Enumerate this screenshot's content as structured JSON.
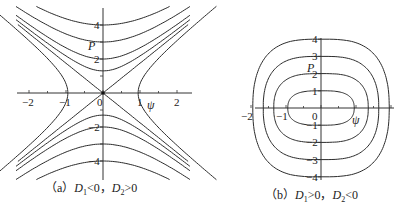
{
  "chart_data": [
    {
      "type": "line",
      "title": "(a) D1<0, D2>0",
      "caption": {
        "prefix": "（a）",
        "d1": "D",
        "d1_sub": "1",
        "rel1": "<0，",
        "d2": "D",
        "d2_sub": "2",
        "rel2": ">0"
      },
      "xlabel": "ψ",
      "ylabel": "P",
      "xlim": [
        -2.3,
        2.3
      ],
      "ylim": [
        -5,
        5
      ],
      "xticks": [
        -2,
        -1,
        0,
        1,
        2
      ],
      "yticks": [
        -4,
        -2,
        2,
        4
      ],
      "grid": false,
      "description": "Phase portrait with saddle at origin: separatrices P=±1.75ψ, hyperbolic level curves above/below and left/right",
      "series": [
        {
          "name": "separatrix-1",
          "kind": "line",
          "slope": 1.75
        },
        {
          "name": "separatrix-2",
          "kind": "line",
          "slope": -1.75
        },
        {
          "name": "upper-1",
          "kind": "hyperbola-vertical",
          "vertex": 1.3
        },
        {
          "name": "upper-2",
          "kind": "hyperbola-vertical",
          "vertex": 2.0
        },
        {
          "name": "upper-3",
          "kind": "hyperbola-vertical",
          "vertex": 3.0
        },
        {
          "name": "upper-4",
          "kind": "hyperbola-vertical",
          "vertex": 4.0
        },
        {
          "name": "lower-1",
          "kind": "hyperbola-vertical",
          "vertex": -1.3
        },
        {
          "name": "lower-2",
          "kind": "hyperbola-vertical",
          "vertex": -2.0
        },
        {
          "name": "lower-3",
          "kind": "hyperbola-vertical",
          "vertex": -3.0
        },
        {
          "name": "lower-4",
          "kind": "hyperbola-vertical",
          "vertex": -4.0
        },
        {
          "name": "side-right",
          "kind": "hyperbola-horizontal",
          "vertex": 0.95
        },
        {
          "name": "side-left",
          "kind": "hyperbola-horizontal",
          "vertex": -0.95
        }
      ]
    },
    {
      "type": "line",
      "title": "(b) D1>0, D2<0",
      "caption": {
        "prefix": "（b）",
        "d1": "D",
        "d1_sub": "1",
        "rel1": ">0，",
        "d2": "D",
        "d2_sub": "2",
        "rel2": "<0"
      },
      "xlabel": "ψ",
      "ylabel": "P",
      "xlim": [
        -2.1,
        2.1
      ],
      "ylim": [
        -4,
        4
      ],
      "xticks": [
        -2,
        -1,
        0
      ],
      "yticks": [
        -4,
        -3,
        -2,
        -1,
        1,
        2,
        3,
        4
      ],
      "grid": false,
      "description": "Phase portrait with center at origin: closed rounded-rectangular orbits",
      "series": [
        {
          "name": "orbit-1",
          "kind": "closed",
          "a": 0.95,
          "b": 1.0
        },
        {
          "name": "orbit-2",
          "kind": "closed",
          "a": 1.35,
          "b": 2.0
        },
        {
          "name": "orbit-3",
          "kind": "closed",
          "a": 1.65,
          "b": 3.0
        },
        {
          "name": "orbit-4",
          "kind": "closed",
          "a": 1.95,
          "b": 4.0
        }
      ]
    }
  ]
}
